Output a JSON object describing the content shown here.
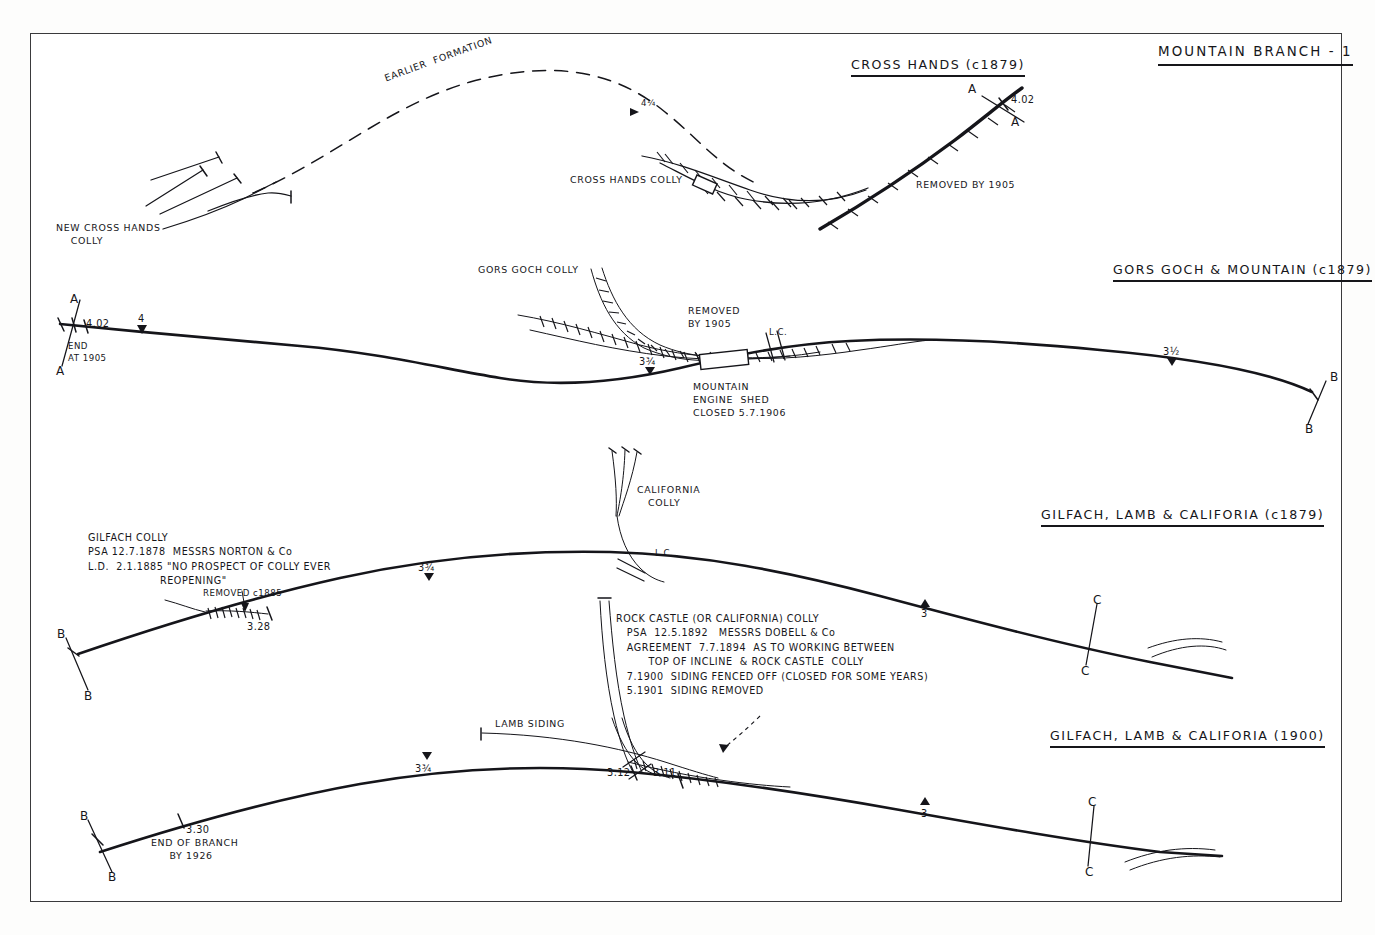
{
  "sheet": {
    "title": "MOUNTAIN BRANCH - 1"
  },
  "panels": [
    {
      "id": "cross-hands",
      "header": "CROSS HANDS (c1879)",
      "labels": {
        "earlier_formation": "EARLIER  FORMATION",
        "new_colly": "NEW CROSS HANDS\n    COLLY",
        "colly": "CROSS HANDS COLLY",
        "removed": "REMOVED BY 1905",
        "milepost_402": "4.02",
        "milepost_4q": "4¼",
        "section_top": "A",
        "section_bottom": "A"
      }
    },
    {
      "id": "gors-goch-mountain",
      "header": "GORS GOCH & MOUNTAIN (c1879)",
      "labels": {
        "section_a_top": "A",
        "section_a_bottom": "A",
        "milepost_402": "4.02",
        "milepost_4": "4",
        "end_at_1905": "END\nAT 1905",
        "gors_goch_colly": "GORS GOCH COLLY",
        "removed": "REMOVED\nBY 1905",
        "level_crossing": "L.C.",
        "milepost_334": "3¾",
        "engine_shed": "MOUNTAIN\nENGINE  SHED\nCLOSED 5.7.1906",
        "milepost_312": "3½",
        "section_b_top": "B",
        "section_b_bottom": "B"
      }
    },
    {
      "id": "gilfach-lamb-california-1879",
      "header": "GILFACH, LAMB & CALIFORIA (c1879)",
      "labels": {
        "california_colly": "CALIFORNIA\n   COLLY",
        "level_crossing": "L.C.",
        "gilfach_note": "GILFACH COLLY\nPSA 12.7.1878  MESSRS NORTON & Co\nL.D.  2.1.1885 \"NO PROSPECT OF COLLY EVER\n                    REOPENING\"",
        "removed_c1885": "REMOVED c1885",
        "milepost_328": "3.28",
        "milepost_334": "3¾",
        "milepost_3": "3",
        "section_b_top": "B",
        "section_b_bottom": "B",
        "section_c_top": "C",
        "section_c_bottom": "C",
        "rock_castle_note": "ROCK CASTLE (OR CALIFORNIA) COLLY\n   PSA  12.5.1892   MESSRS DOBELL & Co\n   AGREEMENT  7.7.1894  AS TO WORKING BETWEEN\n         TOP OF INCLINE  & ROCK CASTLE  COLLY\n   7.1900  SIDING FENCED OFF (CLOSED FOR SOME YEARS)\n   5.1901  SIDING REMOVED"
      }
    },
    {
      "id": "gilfach-lamb-california-1900",
      "header": "GILFACH, LAMB & CALIFORIA (1900)",
      "labels": {
        "lamb_siding": "LAMB SIDING",
        "milepost_334": "3¾",
        "milepost_312": "3.12",
        "milepost_311": "3.11",
        "milepost_3": "3",
        "milepost_330": "3.30",
        "end_of_branch": "END OF BRANCH\n     BY 1926",
        "section_b_top": "B",
        "section_b_bottom": "B",
        "section_c_top": "C",
        "section_c_bottom": "C"
      }
    }
  ],
  "colors": {
    "ink": "#15151a",
    "paper": "#ffffff",
    "border": "#3a3a3c"
  }
}
